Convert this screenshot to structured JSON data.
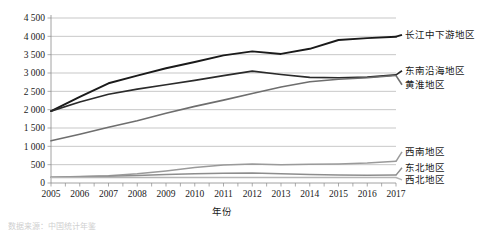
{
  "chart_data": {
    "type": "line",
    "title": "",
    "xlabel": "年份",
    "ylabel": "",
    "x": [
      2005,
      2006,
      2007,
      2008,
      2009,
      2010,
      2011,
      2012,
      2013,
      2014,
      2015,
      2016,
      2017
    ],
    "categories": [
      "2005",
      "2006",
      "2007",
      "2008",
      "2009",
      "2010",
      "2011",
      "2012",
      "2013",
      "2014",
      "2015",
      "2016",
      "2017"
    ],
    "ylim": [
      0,
      4500
    ],
    "ytick_labels": [
      "0",
      "500",
      "1 000",
      "1 500",
      "2 000",
      "2 500",
      "3 000",
      "3 500",
      "4 000",
      "4 500"
    ],
    "ytick_values": [
      0,
      500,
      1000,
      1500,
      2000,
      2500,
      3000,
      3500,
      4000,
      4500
    ],
    "grid": true,
    "legend_position": "right-inline",
    "series": [
      {
        "name": "长江中下游地区",
        "color": "#1a1a1a",
        "width": 1.9,
        "values": [
          1960,
          2350,
          2720,
          2930,
          3130,
          3300,
          3480,
          3590,
          3520,
          3660,
          3900,
          3950,
          3990
        ]
      },
      {
        "name": "东南沿海地区",
        "color": "#2b2b2b",
        "width": 1.7,
        "values": [
          1960,
          2210,
          2420,
          2560,
          2680,
          2800,
          2930,
          3050,
          2960,
          2880,
          2870,
          2890,
          2950
        ]
      },
      {
        "name": "黄淮地区",
        "color": "#6e6e6e",
        "width": 1.6,
        "values": [
          1150,
          1330,
          1520,
          1700,
          1900,
          2090,
          2260,
          2440,
          2620,
          2760,
          2830,
          2870,
          2930
        ]
      },
      {
        "name": "西南地区",
        "color": "#9a9a9a",
        "width": 1.5,
        "values": [
          160,
          175,
          200,
          250,
          330,
          420,
          490,
          520,
          500,
          510,
          520,
          545,
          590
        ]
      },
      {
        "name": "东北地区",
        "color": "#8d8d8d",
        "width": 1.5,
        "values": [
          160,
          170,
          185,
          205,
          230,
          250,
          265,
          270,
          255,
          235,
          215,
          210,
          215
        ]
      },
      {
        "name": "西北地区",
        "color": "#b5b5b5",
        "width": 1.4,
        "values": [
          150,
          150,
          150,
          150,
          150,
          150,
          150,
          150,
          150,
          150,
          150,
          150,
          150
        ]
      }
    ],
    "inline_labels": [
      {
        "text": "长江中下游地区",
        "series": "长江中下游地区",
        "y": 38
      },
      {
        "text": "东南沿海地区",
        "series": "东南沿海地区",
        "y": 74
      },
      {
        "text": "黄淮地区",
        "series": "黄淮地区",
        "y": 88
      },
      {
        "text": "西南地区",
        "series": "西南地区",
        "y": 155
      },
      {
        "text": "东北地区",
        "series": "东北地区",
        "y": 171
      },
      {
        "text": "西北地区",
        "series": "西北地区",
        "y": 183
      }
    ]
  },
  "caption": {
    "text": "数据来源：中国统计年鉴"
  }
}
